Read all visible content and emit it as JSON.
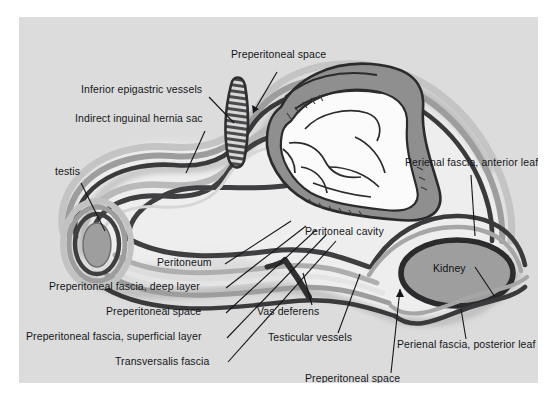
{
  "figure": {
    "panel": {
      "background_color": "#dcdcdc",
      "outer_background_color": "#ffffff",
      "x": 19,
      "y": 17,
      "width": 519,
      "height": 366
    },
    "palette": {
      "outer_background": "#ffffff",
      "panel_background": "#dcdcdc",
      "light_field": "#e8e8e8",
      "pale_field": "#f0f0f0",
      "dark_line": "#3a3a3c",
      "mid_gray_band": "#9a9a9a",
      "light_gray_band": "#bfbfbf",
      "organ_fill": "#9e9e9e",
      "organ_outline": "#2b2b2d",
      "cavity_fill": "#fbfbfb",
      "shadow_gray": "#b2b2b2",
      "label_text": "#15161a"
    },
    "labels": [
      {
        "id": "preperitoneal-space-top",
        "text": "Preperitoneal space",
        "x": 212,
        "y": 37,
        "leader": {
          "from": [
            258,
            55
          ],
          "to": [
            232,
            99
          ],
          "arrow": true
        }
      },
      {
        "id": "inferior-epigastric-vessels",
        "text": "Inferior epigastric vessels",
        "x": 62,
        "y": 72,
        "leader": {
          "from": [
            190,
            80
          ],
          "to": [
            214,
            105
          ],
          "arrow": false
        }
      },
      {
        "id": "indirect-inguinal-hernia-sac",
        "text": "Indirect inguinal hernia sac",
        "x": 56,
        "y": 101,
        "leader": {
          "from": [
            186,
            114
          ],
          "to": [
            166,
            155
          ],
          "arrow": false
        }
      },
      {
        "id": "testis",
        "text": "testis",
        "x": 36,
        "y": 153,
        "leader": {
          "from": [
            62,
            166
          ],
          "to": [
            86,
            212
          ],
          "arrow": false
        }
      },
      {
        "id": "peritoneum",
        "text": "Peritoneum",
        "x": 138,
        "y": 244,
        "leader": {
          "from": [
            205,
            248
          ],
          "to": [
            272,
            205
          ],
          "arrow": false
        }
      },
      {
        "id": "preperitoneal-fascia-deep-layer",
        "text": "Preperitoneal fascia, deep layer",
        "x": 48,
        "y": 268,
        "leader": {
          "from": [
            206,
            271
          ],
          "to": [
            286,
            210
          ],
          "arrow": false
        }
      },
      {
        "id": "preperitoneal-space-left",
        "text": "Preperitoneal space",
        "x": 105,
        "y": 294,
        "leader": {
          "from": [
            206,
            296
          ],
          "to": [
            296,
            214
          ],
          "arrow": false
        }
      },
      {
        "id": "preperitoneal-fascia-superficial-layer",
        "text": "Preperitoneal fascia, superficial layer",
        "x": 25,
        "y": 320,
        "leader": {
          "from": [
            207,
            321
          ],
          "to": [
            306,
            219
          ],
          "arrow": false
        }
      },
      {
        "id": "transversalis-fascia",
        "text": "Transversalis fascia",
        "x": 114,
        "y": 346,
        "leader": {
          "from": [
            208,
            345
          ],
          "to": [
            316,
            225
          ],
          "arrow": false
        }
      },
      {
        "id": "vas-deferens",
        "text": "Vas deferens",
        "x": 257,
        "y": 294,
        "leader": {
          "from": [
            292,
            289
          ],
          "to": [
            283,
            257
          ],
          "arrow": false
        }
      },
      {
        "id": "testicular-vessels",
        "text": "Testicular vessels",
        "x": 268,
        "y": 321,
        "leader": {
          "from": [
            318,
            317
          ],
          "to": [
            340,
            258
          ],
          "arrow": false
        }
      },
      {
        "id": "preperitoneal-space-bottom",
        "text": "Preperitoneal space",
        "x": 305,
        "y": 364,
        "leader": {
          "from": [
            372,
            357
          ],
          "to": [
            380,
            267
          ],
          "arrow": true
        }
      },
      {
        "id": "peritoneal-cavity",
        "text": "Peritoneal cavity",
        "x": 305,
        "y": 214,
        "leader": null
      },
      {
        "id": "perienal-fascia-anterior-leaf",
        "text": "Perienal fascia, anterior leaf",
        "x": 405,
        "y": 145,
        "leader": {
          "from": [
            452,
            158
          ],
          "to": [
            455,
            218
          ],
          "arrow": false
        }
      },
      {
        "id": "kidney",
        "text": "Kidney",
        "x": 414,
        "y": 251,
        "leader": {
          "from": [
            455,
            254
          ],
          "to": [
            474,
            278
          ],
          "arrow": false
        }
      },
      {
        "id": "perienal-fascia-posterior-leaf",
        "text": "Perienal fascia, posterior leaf",
        "x": 397,
        "y": 327,
        "leader": {
          "from": [
            446,
            323
          ],
          "to": [
            441,
            292
          ],
          "arrow": false
        }
      }
    ],
    "structures": [
      {
        "name": "testis",
        "kind": "organ",
        "fill": "#9e9e9e"
      },
      {
        "name": "kidney",
        "kind": "organ",
        "fill": "#9e9e9e"
      },
      {
        "name": "intestinal-mass",
        "kind": "viscera",
        "fill": "#fbfbfb"
      },
      {
        "name": "inferior-epigastric-vessels",
        "kind": "vessel",
        "pattern": "hatched"
      },
      {
        "name": "vas-deferens",
        "kind": "duct"
      },
      {
        "name": "testicular-vessels",
        "kind": "vessel"
      },
      {
        "name": "peritoneum",
        "kind": "membrane-line"
      },
      {
        "name": "transversalis-fascia",
        "kind": "membrane-line"
      },
      {
        "name": "preperitoneal-fascia-deep-layer",
        "kind": "membrane-line"
      },
      {
        "name": "preperitoneal-fascia-superficial-layer",
        "kind": "membrane-line"
      },
      {
        "name": "perienal-fascia-anterior-leaf",
        "kind": "membrane-line"
      },
      {
        "name": "perienal-fascia-posterior-leaf",
        "kind": "membrane-line"
      }
    ]
  }
}
